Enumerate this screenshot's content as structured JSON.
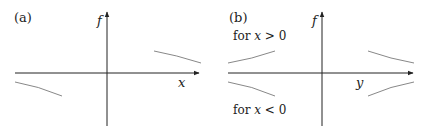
{
  "panels": [
    {
      "id": "a",
      "label": "(a)",
      "vertical_axis_label": "f",
      "horizontal_axis_label": "x",
      "description": "f versus x: two branches, decaying curve in quadrant I and in quadrant III"
    },
    {
      "id": "b",
      "label": "(b)",
      "vertical_axis_label": "f",
      "horizontal_axis_label": "y",
      "annotation_top": "for x > 0",
      "annotation_bottom": "for x < 0",
      "annotation_top_parts": {
        "pre": "for ",
        "var": "x",
        "post": " > 0"
      },
      "annotation_bottom_parts": {
        "pre": "for ",
        "var": "x",
        "post": " < 0"
      },
      "description": "f versus y: symmetric branches above the axis for x > 0 and below for x < 0"
    }
  ],
  "colors": {
    "axis": "#222222",
    "curve": "#888888",
    "text": "#222222"
  }
}
